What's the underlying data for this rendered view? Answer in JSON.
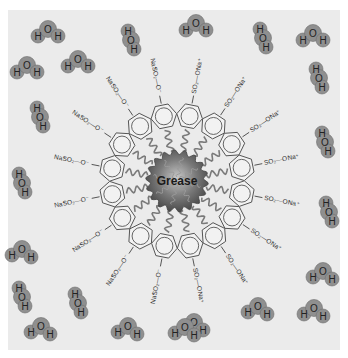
{
  "figure": {
    "type": "micelle diagram",
    "center_label": "Grease",
    "colors": {
      "background_panel": "#ebebeb",
      "water_blob": "#8f8f8f",
      "water_blob_edge": "#6e6e6e",
      "grease_core": "#6a6a6a",
      "ring_stroke": "#555555",
      "tail_stroke": "#7a7a7a"
    },
    "surfactant": {
      "count": 16,
      "head_group_label": "SO₂—O⁻",
      "counter_ion_label": "Na⁺"
    },
    "water_molecules": [
      {
        "x": 48,
        "y": 33,
        "label": "H-O-H",
        "orient": "bent-up"
      },
      {
        "x": 131,
        "y": 40,
        "label": "H-O-H",
        "orient": "vertical"
      },
      {
        "x": 196,
        "y": 27,
        "label": "H-O-H",
        "orient": "bent-up"
      },
      {
        "x": 263,
        "y": 38,
        "label": "H-O-H",
        "orient": "vertical"
      },
      {
        "x": 313,
        "y": 37,
        "label": "H-O-H",
        "orient": "bent-up"
      },
      {
        "x": 27,
        "y": 69,
        "label": "H-O-H",
        "orient": "bent-up"
      },
      {
        "x": 78,
        "y": 63,
        "label": "H-O-H",
        "orient": "bent-up"
      },
      {
        "x": 319,
        "y": 78,
        "label": "H-O-H",
        "orient": "vertical"
      },
      {
        "x": 40,
        "y": 117,
        "label": "H-O-H",
        "orient": "vertical"
      },
      {
        "x": 325,
        "y": 142,
        "label": "H-O-H",
        "orient": "vertical"
      },
      {
        "x": 22,
        "y": 183,
        "label": "H-O-H",
        "orient": "vertical"
      },
      {
        "x": 329,
        "y": 212,
        "label": "H-O-H",
        "orient": "vertical"
      },
      {
        "x": 22,
        "y": 252,
        "label": "H-O-H",
        "orient": "bent-down"
      },
      {
        "x": 323,
        "y": 274,
        "label": "H-O-H",
        "orient": "bent-down"
      },
      {
        "x": 22,
        "y": 297,
        "label": "H-O-H",
        "orient": "vertical"
      },
      {
        "x": 78,
        "y": 303,
        "label": "H-O-H",
        "orient": "vertical"
      },
      {
        "x": 258,
        "y": 309,
        "label": "H-O-H",
        "orient": "bent-down"
      },
      {
        "x": 314,
        "y": 311,
        "label": "H-O-H",
        "orient": "bent-down"
      },
      {
        "x": 41,
        "y": 329,
        "label": "H-O-H",
        "orient": "bent-down"
      },
      {
        "x": 128,
        "y": 329,
        "label": "H-O-H",
        "orient": "bent-down"
      },
      {
        "x": 194,
        "y": 325,
        "label": "H-O-H",
        "orient": "bent-down"
      },
      {
        "x": 185,
        "y": 330,
        "label": "H-O-H",
        "orient": "bent-down"
      }
    ]
  }
}
